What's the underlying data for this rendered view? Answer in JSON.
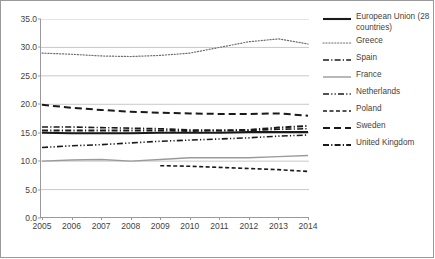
{
  "chart_data": {
    "type": "line",
    "title": "",
    "subtitle": "",
    "xlabel": "",
    "ylabel": "",
    "x": [
      2005,
      2006,
      2007,
      2008,
      2009,
      2010,
      2011,
      2012,
      2013,
      2014
    ],
    "categories": [
      "2005",
      "2006",
      "2007",
      "2008",
      "2009",
      "2010",
      "2011",
      "2012",
      "2013",
      "2014"
    ],
    "xlim": [
      2005,
      2014
    ],
    "ylim": [
      0.0,
      35.0
    ],
    "yticks": [
      "0.0",
      "5.0",
      "10.0",
      "15.0",
      "20.0",
      "25.0",
      "30.0",
      "35.0"
    ],
    "ytick_values": [
      0.0,
      5.0,
      10.0,
      15.0,
      20.0,
      25.0,
      30.0,
      35.0
    ],
    "grid": true,
    "grid_axis": "y",
    "legend_position": "right",
    "series": [
      {
        "name": "European Union (28 countries)",
        "style": "solid",
        "color": "#1a1a1a",
        "width": 2.1,
        "values": [
          15.0,
          14.9,
          14.9,
          14.9,
          15.0,
          15.0,
          15.0,
          15.1,
          15.1,
          15.1
        ]
      },
      {
        "name": "Greece",
        "style": "dotted",
        "color": "#6e6e6e",
        "width": 1.2,
        "values": [
          29.0,
          28.8,
          28.5,
          28.4,
          28.6,
          29.0,
          30.0,
          31.0,
          31.5,
          30.6
        ]
      },
      {
        "name": "Spain",
        "style": "dashdot",
        "color": "#1a1a1a",
        "width": 1.6,
        "values": [
          16.0,
          16.0,
          15.9,
          15.8,
          15.7,
          15.5,
          15.4,
          15.4,
          15.6,
          15.7
        ]
      },
      {
        "name": "France",
        "style": "solid",
        "color": "#9a9a9a",
        "width": 1.4,
        "values": [
          10.0,
          10.2,
          10.3,
          10.0,
          10.3,
          10.6,
          10.6,
          10.6,
          10.8,
          11.0
        ]
      },
      {
        "name": "Netherlands",
        "style": "dashdotdot",
        "color": "#1a1a1a",
        "width": 1.6,
        "values": [
          12.4,
          12.7,
          12.9,
          13.2,
          13.5,
          13.7,
          13.9,
          14.1,
          14.4,
          14.6
        ]
      },
      {
        "name": "Poland",
        "style": "dashed-short",
        "color": "#1a1a1a",
        "width": 1.6,
        "values": [
          null,
          null,
          null,
          null,
          9.2,
          9.1,
          8.9,
          8.7,
          8.5,
          8.2
        ]
      },
      {
        "name": "Sweden",
        "style": "dashed-long",
        "color": "#1a1a1a",
        "width": 2.0,
        "values": [
          19.9,
          19.4,
          19.0,
          18.7,
          18.5,
          18.4,
          18.3,
          18.3,
          18.4,
          18.0
        ]
      },
      {
        "name": "United Kingdom",
        "style": "dashdot",
        "color": "#1a1a1a",
        "width": 2.0,
        "values": [
          15.4,
          15.4,
          15.4,
          15.4,
          15.4,
          15.3,
          15.4,
          15.5,
          15.9,
          16.2
        ]
      }
    ]
  }
}
